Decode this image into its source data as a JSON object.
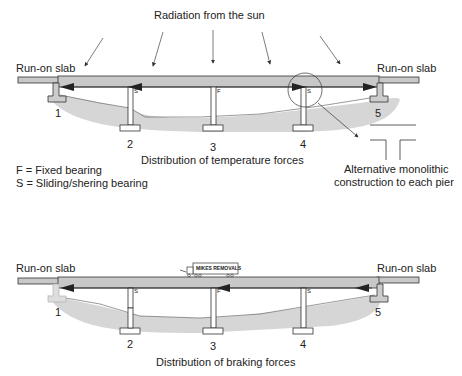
{
  "top_diagram": {
    "title": "Radiation from the sun",
    "caption": "Distribution of temperature forces",
    "left_slab_label": "Run-on slab",
    "right_slab_label": "Run-on slab",
    "supports": [
      "1",
      "2",
      "3",
      "4",
      "5"
    ],
    "bearing_marks": {
      "pier2": "S",
      "pier3": "F",
      "pier4": "S"
    },
    "legend": [
      "F = Fixed bearing",
      "S = Sliding/shering bearing"
    ],
    "detail_caption_line1": "Alternative monolithic",
    "detail_caption_line2": "construction to each pier"
  },
  "bottom_diagram": {
    "caption": "Distribution of braking forces",
    "left_slab_label": "Run-on slab",
    "right_slab_label": "Run-on slab",
    "supports": [
      "1",
      "2",
      "3",
      "4",
      "5"
    ],
    "bearing_marks": {
      "pier2": "S",
      "pier3": "F",
      "pier4": "S"
    },
    "truck_label": "MIKES REMOVALS"
  },
  "colors": {
    "deck": "#c8c8c8",
    "ground": "#d6d6d6",
    "line": "#222222"
  }
}
